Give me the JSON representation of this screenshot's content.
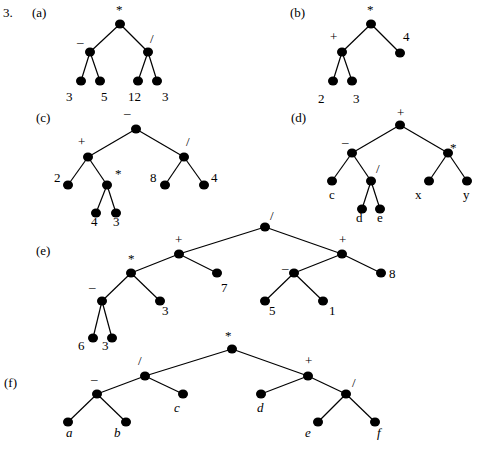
{
  "problem_number": "3.",
  "trees": [
    {
      "id": "a",
      "part_label": "(a)",
      "part_pos": [
        32,
        17
      ],
      "nodes": [
        {
          "id": "r",
          "x": 120,
          "y": 24,
          "label": "*",
          "lx": 116,
          "ly": 14,
          "kind": "op"
        },
        {
          "id": "n1",
          "x": 90,
          "y": 52,
          "label": "–",
          "lx": 77,
          "ly": 46,
          "kind": "op"
        },
        {
          "id": "n2",
          "x": 148,
          "y": 52,
          "label": "/",
          "lx": 150,
          "ly": 43,
          "kind": "op"
        },
        {
          "id": "l1",
          "x": 81,
          "y": 81,
          "label": "3",
          "lx": 66,
          "ly": 101,
          "kind": "leaf"
        },
        {
          "id": "l2",
          "x": 100,
          "y": 81,
          "label": "5",
          "lx": 101,
          "ly": 101,
          "kind": "leaf"
        },
        {
          "id": "l3",
          "x": 138,
          "y": 81,
          "label": "12",
          "lx": 128,
          "ly": 101,
          "kind": "leaf"
        },
        {
          "id": "l4",
          "x": 157,
          "y": 81,
          "label": "3",
          "lx": 162,
          "ly": 101,
          "kind": "leaf"
        }
      ],
      "edges": [
        [
          "r",
          "n1"
        ],
        [
          "r",
          "n2"
        ],
        [
          "n1",
          "l1"
        ],
        [
          "n1",
          "l2"
        ],
        [
          "n2",
          "l3"
        ],
        [
          "n2",
          "l4"
        ]
      ]
    },
    {
      "id": "b",
      "part_label": "(b)",
      "part_pos": [
        290,
        17
      ],
      "nodes": [
        {
          "id": "r",
          "x": 371,
          "y": 24,
          "label": "*",
          "lx": 367,
          "ly": 14,
          "kind": "op"
        },
        {
          "id": "n1",
          "x": 342,
          "y": 52,
          "label": "+",
          "lx": 330,
          "ly": 41,
          "kind": "op"
        },
        {
          "id": "n2",
          "x": 400,
          "y": 53,
          "label": "4",
          "lx": 403,
          "ly": 41,
          "kind": "leaf"
        },
        {
          "id": "l1",
          "x": 333,
          "y": 81,
          "label": "2",
          "lx": 318,
          "ly": 103,
          "kind": "leaf"
        },
        {
          "id": "l2",
          "x": 352,
          "y": 81,
          "label": "3",
          "lx": 353,
          "ly": 103,
          "kind": "leaf"
        }
      ],
      "edges": [
        [
          "r",
          "n1"
        ],
        [
          "r",
          "n2"
        ],
        [
          "n1",
          "l1"
        ],
        [
          "n1",
          "l2"
        ]
      ]
    },
    {
      "id": "c",
      "part_label": "(c)",
      "part_pos": [
        36,
        122
      ],
      "nodes": [
        {
          "id": "r",
          "x": 136,
          "y": 129,
          "label": "–",
          "lx": 124,
          "ly": 117,
          "kind": "op"
        },
        {
          "id": "n1",
          "x": 88,
          "y": 157,
          "label": "+",
          "lx": 78,
          "ly": 146,
          "kind": "op"
        },
        {
          "id": "n2",
          "x": 184,
          "y": 157,
          "label": "/",
          "lx": 186,
          "ly": 146,
          "kind": "op"
        },
        {
          "id": "l1",
          "x": 68,
          "y": 185,
          "label": "2",
          "lx": 54,
          "ly": 182,
          "kind": "leaf"
        },
        {
          "id": "n3",
          "x": 107,
          "y": 185,
          "label": "*",
          "lx": 115,
          "ly": 178,
          "kind": "op"
        },
        {
          "id": "l2",
          "x": 165,
          "y": 185,
          "label": "8",
          "lx": 150,
          "ly": 182,
          "kind": "leaf"
        },
        {
          "id": "l3",
          "x": 204,
          "y": 185,
          "label": "4",
          "lx": 211,
          "ly": 182,
          "kind": "leaf"
        },
        {
          "id": "l4",
          "x": 96,
          "y": 213,
          "label": "4",
          "lx": 91,
          "ly": 226,
          "kind": "leaf"
        },
        {
          "id": "l5",
          "x": 116,
          "y": 213,
          "label": "3",
          "lx": 113,
          "ly": 226,
          "kind": "leaf"
        }
      ],
      "edges": [
        [
          "r",
          "n1"
        ],
        [
          "r",
          "n2"
        ],
        [
          "n1",
          "l1"
        ],
        [
          "n1",
          "n3"
        ],
        [
          "n2",
          "l2"
        ],
        [
          "n2",
          "l3"
        ],
        [
          "n3",
          "l4"
        ],
        [
          "n3",
          "l5"
        ]
      ]
    },
    {
      "id": "d",
      "part_label": "(d)",
      "part_pos": [
        291,
        122
      ],
      "nodes": [
        {
          "id": "r",
          "x": 400,
          "y": 125,
          "label": "+",
          "lx": 397,
          "ly": 117,
          "kind": "op"
        },
        {
          "id": "n1",
          "x": 352,
          "y": 153,
          "label": "–",
          "lx": 342,
          "ly": 146,
          "kind": "op"
        },
        {
          "id": "n2",
          "x": 448,
          "y": 153,
          "label": "*",
          "lx": 450,
          "ly": 152,
          "kind": "op"
        },
        {
          "id": "l1",
          "x": 332,
          "y": 181,
          "label": "c",
          "lx": 329,
          "ly": 199,
          "kind": "leaf"
        },
        {
          "id": "n3",
          "x": 371,
          "y": 181,
          "label": "/",
          "lx": 376,
          "ly": 173,
          "kind": "op"
        },
        {
          "id": "l2",
          "x": 429,
          "y": 181,
          "label": "x",
          "lx": 415,
          "ly": 199,
          "kind": "leaf"
        },
        {
          "id": "l3",
          "x": 467,
          "y": 181,
          "label": "y",
          "lx": 463,
          "ly": 199,
          "kind": "leaf"
        },
        {
          "id": "l4",
          "x": 362,
          "y": 209,
          "label": "d",
          "lx": 356,
          "ly": 222,
          "kind": "leaf"
        },
        {
          "id": "l5",
          "x": 380,
          "y": 209,
          "label": "e",
          "lx": 377,
          "ly": 222,
          "kind": "leaf"
        }
      ],
      "edges": [
        [
          "r",
          "n1"
        ],
        [
          "r",
          "n2"
        ],
        [
          "n1",
          "l1"
        ],
        [
          "n1",
          "n3"
        ],
        [
          "n2",
          "l2"
        ],
        [
          "n2",
          "l3"
        ],
        [
          "n3",
          "l4"
        ],
        [
          "n3",
          "l5"
        ]
      ]
    },
    {
      "id": "e",
      "part_label": "(e)",
      "part_pos": [
        36,
        255
      ],
      "nodes": [
        {
          "id": "r",
          "x": 265,
          "y": 227,
          "label": "/",
          "lx": 270,
          "ly": 220,
          "kind": "op"
        },
        {
          "id": "n1",
          "x": 179,
          "y": 254,
          "label": "+",
          "lx": 175,
          "ly": 244,
          "kind": "op"
        },
        {
          "id": "n2",
          "x": 342,
          "y": 254,
          "label": "+",
          "lx": 339,
          "ly": 244,
          "kind": "op"
        },
        {
          "id": "n3",
          "x": 131,
          "y": 273,
          "label": "*",
          "lx": 128,
          "ly": 263,
          "kind": "op"
        },
        {
          "id": "l1",
          "x": 217,
          "y": 273,
          "label": "7",
          "lx": 221,
          "ly": 292,
          "kind": "leaf"
        },
        {
          "id": "n4",
          "x": 294,
          "y": 273,
          "label": "–",
          "lx": 282,
          "ly": 272,
          "kind": "op"
        },
        {
          "id": "l2",
          "x": 381,
          "y": 273,
          "label": "8",
          "lx": 389,
          "ly": 278,
          "kind": "leaf"
        },
        {
          "id": "n5",
          "x": 102,
          "y": 301,
          "label": "–",
          "lx": 89,
          "ly": 291,
          "kind": "op"
        },
        {
          "id": "l3",
          "x": 160,
          "y": 301,
          "label": "3",
          "lx": 162,
          "ly": 315,
          "kind": "leaf"
        },
        {
          "id": "l4",
          "x": 265,
          "y": 301,
          "label": "5",
          "lx": 269,
          "ly": 315,
          "kind": "leaf"
        },
        {
          "id": "l5",
          "x": 323,
          "y": 301,
          "label": "1",
          "lx": 329,
          "ly": 315,
          "kind": "leaf"
        },
        {
          "id": "l6",
          "x": 93,
          "y": 338,
          "label": "6",
          "lx": 78,
          "ly": 350,
          "kind": "leaf"
        },
        {
          "id": "l7",
          "x": 112,
          "y": 338,
          "label": "3",
          "lx": 102,
          "ly": 350,
          "kind": "leaf"
        }
      ],
      "edges": [
        [
          "r",
          "n1"
        ],
        [
          "r",
          "n2"
        ],
        [
          "n1",
          "n3"
        ],
        [
          "n1",
          "l1"
        ],
        [
          "n2",
          "n4"
        ],
        [
          "n2",
          "l2"
        ],
        [
          "n3",
          "n5"
        ],
        [
          "n3",
          "l3"
        ],
        [
          "n4",
          "l4"
        ],
        [
          "n4",
          "l5"
        ],
        [
          "n5",
          "l6"
        ],
        [
          "n5",
          "l7"
        ]
      ]
    },
    {
      "id": "f",
      "part_label": "(f)",
      "part_pos": [
        4,
        387
      ],
      "nodes": [
        {
          "id": "r",
          "x": 232,
          "y": 349,
          "label": "*",
          "lx": 225,
          "ly": 340,
          "kind": "op"
        },
        {
          "id": "n1",
          "x": 145,
          "y": 376,
          "label": "/",
          "lx": 138,
          "ly": 365,
          "kind": "op"
        },
        {
          "id": "n2",
          "x": 308,
          "y": 376,
          "label": "+",
          "lx": 305,
          "ly": 365,
          "kind": "op"
        },
        {
          "id": "n3",
          "x": 97,
          "y": 394,
          "label": "–",
          "lx": 91,
          "ly": 383,
          "kind": "op"
        },
        {
          "id": "l1",
          "x": 183,
          "y": 394,
          "label": "c",
          "lx": 174,
          "ly": 412,
          "kind": "leaf",
          "italic": true
        },
        {
          "id": "l2",
          "x": 261,
          "y": 394,
          "label": "d",
          "lx": 257,
          "ly": 412,
          "kind": "leaf",
          "italic": true
        },
        {
          "id": "n4",
          "x": 346,
          "y": 394,
          "label": "/",
          "lx": 352,
          "ly": 387,
          "kind": "op"
        },
        {
          "id": "l3",
          "x": 68,
          "y": 422,
          "label": "a",
          "lx": 66,
          "ly": 437,
          "kind": "leaf",
          "italic": true
        },
        {
          "id": "l4",
          "x": 126,
          "y": 422,
          "label": "b",
          "lx": 114,
          "ly": 437,
          "kind": "leaf",
          "italic": true
        },
        {
          "id": "l5",
          "x": 318,
          "y": 422,
          "label": "e",
          "lx": 305,
          "ly": 437,
          "kind": "leaf",
          "italic": true
        },
        {
          "id": "l6",
          "x": 375,
          "y": 422,
          "label": "f",
          "lx": 377,
          "ly": 437,
          "kind": "leaf",
          "italic": true
        }
      ],
      "edges": [
        [
          "r",
          "n1"
        ],
        [
          "r",
          "n2"
        ],
        [
          "n1",
          "n3"
        ],
        [
          "n1",
          "l1"
        ],
        [
          "n2",
          "l2"
        ],
        [
          "n2",
          "n4"
        ],
        [
          "n3",
          "l3"
        ],
        [
          "n3",
          "l4"
        ],
        [
          "n4",
          "l5"
        ],
        [
          "n4",
          "l6"
        ]
      ]
    }
  ]
}
